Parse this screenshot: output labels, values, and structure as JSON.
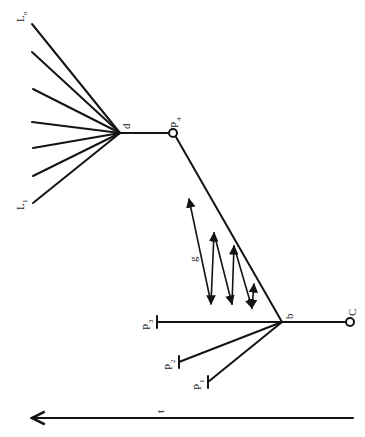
{
  "diagram": {
    "orientation": "rotated 90deg counter-clockwise",
    "colors": {
      "ink": "#141414",
      "background": "#ffffff"
    },
    "nodes": {
      "d": {
        "label": "d",
        "x": 120,
        "y": 133
      },
      "P4": {
        "label": "P",
        "sub": "4",
        "x": 173,
        "y": 133,
        "shape": "open-circle"
      },
      "b": {
        "label": "b",
        "x": 282,
        "y": 322
      },
      "C": {
        "label": "C",
        "x": 350,
        "y": 322,
        "shape": "open-circle"
      },
      "P3": {
        "label": "P",
        "sub": "3",
        "x": 157,
        "y": 322,
        "shape": "bar-end"
      },
      "P2": {
        "label": "P",
        "sub": "2",
        "x": 179,
        "y": 362,
        "shape": "bar-end"
      },
      "P1": {
        "label": "P",
        "sub": "1",
        "x": 208,
        "y": 382,
        "shape": "bar-end"
      }
    },
    "fan_lines": {
      "label_top": {
        "label": "L",
        "sub": "n"
      },
      "label_bottom": {
        "label": "L",
        "sub": "1"
      },
      "endpoints": [
        {
          "x": 32,
          "y": 24
        },
        {
          "x": 32,
          "y": 52
        },
        {
          "x": 33,
          "y": 89
        },
        {
          "x": 32,
          "y": 122
        },
        {
          "x": 33,
          "y": 148
        },
        {
          "x": 33,
          "y": 176
        },
        {
          "x": 33,
          "y": 203
        }
      ]
    },
    "zigzag": {
      "label": "g",
      "arrows": [
        {
          "x1": 211,
          "y1": 303,
          "x2": 189,
          "y2": 198
        },
        {
          "x1": 214,
          "y1": 232,
          "x2": 211,
          "y2": 303
        },
        {
          "x1": 232,
          "y1": 305,
          "x2": 214,
          "y2": 232
        },
        {
          "x1": 234,
          "y1": 245,
          "x2": 232,
          "y2": 305
        },
        {
          "x1": 252,
          "y1": 309,
          "x2": 234,
          "y2": 245
        },
        {
          "x1": 254,
          "y1": 283,
          "x2": 252,
          "y2": 309
        },
        {
          "x1": 252,
          "y1": 309,
          "x2": 254,
          "y2": 283
        }
      ]
    },
    "time_axis": {
      "label": "t",
      "x1": 353,
      "y1": 418,
      "x2": 30,
      "y2": 418
    }
  }
}
